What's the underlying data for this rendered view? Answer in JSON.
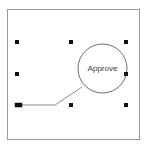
{
  "canvas": {
    "width": 147,
    "height": 147,
    "background_color": "#ffffff",
    "frame": {
      "name": "diagram-frame",
      "x": 7,
      "y": 9,
      "width": 133,
      "height": 131,
      "stroke_color": "#9a9a9a",
      "stroke_width": 1,
      "fill_color": "#ffffff"
    }
  },
  "shapes": [
    {
      "id": "approve-node",
      "type": "ellipse",
      "label": "Approve",
      "cx": 102.5,
      "cy": 68.5,
      "rx": 24.5,
      "ry": 24.5,
      "stroke_color": "#6e6e6e",
      "stroke_width": 1,
      "fill_color": "none",
      "label_color": "#3b3b3b",
      "label_font_size": 8,
      "selected": true
    }
  ],
  "connectors": [
    {
      "id": "incoming-connector",
      "type": "elbow-line",
      "points": "18,105 55,105 82,87",
      "stroke_color": "#8a8a8a",
      "stroke_width": 1,
      "start_marker": "square-endpoint",
      "end_marker": "none"
    }
  ],
  "selection": {
    "name": "selection-handles",
    "handle_size": 4,
    "handle_fill": "#111111",
    "handle_stroke": "#111111",
    "bounds": {
      "x": 17,
      "y": 42,
      "width": 109,
      "height": 63
    },
    "handles": [
      {
        "name": "handle-top-left",
        "x": 17,
        "y": 42
      },
      {
        "name": "handle-top-center",
        "x": 71,
        "y": 42
      },
      {
        "name": "handle-top-right",
        "x": 126,
        "y": 42
      },
      {
        "name": "handle-middle-left",
        "x": 17,
        "y": 74
      },
      {
        "name": "handle-middle-right",
        "x": 126,
        "y": 74
      },
      {
        "name": "handle-bottom-left",
        "x": 17,
        "y": 105
      },
      {
        "name": "handle-bottom-center",
        "x": 71,
        "y": 105
      },
      {
        "name": "handle-bottom-right",
        "x": 126,
        "y": 105
      }
    ]
  }
}
